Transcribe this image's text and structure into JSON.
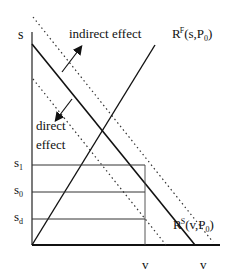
{
  "diagram": {
    "y_axis_label": "s",
    "x_axis_labels": [
      "v",
      "v"
    ],
    "curves": {
      "rf": {
        "base": "R",
        "sup": "F",
        "args": "(s,P",
        "sub": "0",
        "close": ")"
      },
      "rs": {
        "base": "R",
        "sup": "S",
        "args": "(v,P",
        "sub": "0",
        "close": ")"
      }
    },
    "annotations": {
      "indirect": "indirect effect",
      "direct_line1": "direct",
      "direct_line2": "effect"
    },
    "levels": [
      {
        "base": "s",
        "sub": "1"
      },
      {
        "base": "s",
        "sub": "0"
      },
      {
        "base": "s",
        "sub": "d"
      }
    ],
    "colors": {
      "line": "#111111",
      "background": "#ffffff"
    }
  }
}
